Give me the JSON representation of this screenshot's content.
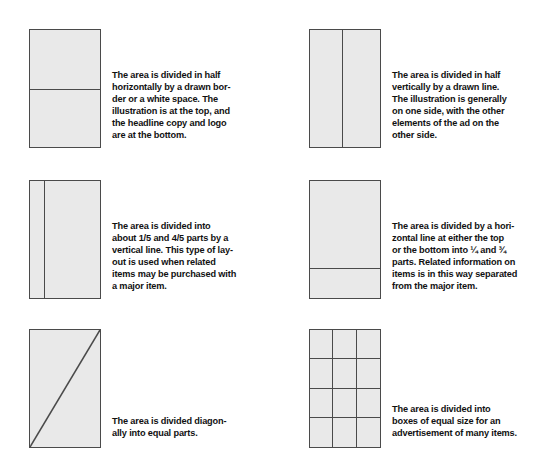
{
  "page": {
    "background_color": "#ffffff",
    "figure_fill_color": "#e9e9e9",
    "figure_stroke_color": "#4a4a4a",
    "text_color": "#111111"
  },
  "items": [
    {
      "id": "divided-in-half-horizontally",
      "figure": {
        "shape": "rectangle",
        "division": "horizontal-line",
        "divider_position_percent": 50
      },
      "caption": "The area is divided in half\nhorizontally by a drawn bor-\nder or a white space. The\nillustration is at the top, and\nthe headline copy and logo\nare at the bottom."
    },
    {
      "id": "divided-in-half-vertically",
      "figure": {
        "shape": "rectangle",
        "division": "vertical-line",
        "divider_position_percent": 45
      },
      "caption": "The area is divided in half\nvertically by a drawn line.\nThe illustration is generally\non one side, with the other\nelements of the ad on the\nother side."
    },
    {
      "id": "divided-one-fifth-four-fifths",
      "figure": {
        "shape": "rectangle",
        "division": "vertical-line",
        "divider_position_percent": 20
      },
      "caption": "The area is divided into\nabout 1/5 and 4/5 parts by a\nvertical line. This type of lay-\nout is used when related\nitems may be purchased with\na major item."
    },
    {
      "id": "divided-quarter-three-quarters",
      "figure": {
        "shape": "rectangle",
        "division": "horizontal-line",
        "divider_position_percent": 74
      },
      "caption": "The area is divided by a hori-\nzontal line at either the top\nor the bottom into ¼ and ¾\nparts. Related information on\nitems is in this way separated\nfrom the major item."
    },
    {
      "id": "divided-diagonally",
      "figure": {
        "shape": "rectangle",
        "division": "diagonal-line",
        "diagonal_from": "bottom-left",
        "diagonal_to": "top-right"
      },
      "caption": "The area is divided diagon-\nally into equal parts."
    },
    {
      "id": "divided-into-equal-boxes",
      "figure": {
        "shape": "rectangle",
        "division": "grid",
        "grid_columns": 3,
        "grid_rows": 4
      },
      "caption": "The area is divided into\nboxes of equal size for an\nadvertisement of many items."
    }
  ]
}
